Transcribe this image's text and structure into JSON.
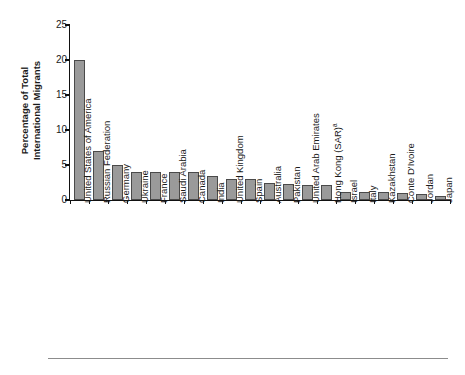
{
  "chart_data": {
    "type": "bar",
    "title": "",
    "xlabel": "",
    "ylabel": "Percentage of Total International Migrants",
    "ylabel_line1": "Percentage of Total",
    "ylabel_line2": "International Migrants",
    "ylim": [
      0,
      25
    ],
    "yticks": [
      0,
      5,
      10,
      15,
      20,
      25
    ],
    "grid": false,
    "legend": false,
    "bar_color": "#9a9a9a",
    "bar_border_color": "#4a4a4a",
    "footnote_marker": "a",
    "categories": [
      "United States of America",
      "Russian Federation",
      "Germany",
      "Ukraine",
      "France",
      "Saudi Arabia",
      "Canada",
      "India",
      "United Kingdom",
      "Spain",
      "Australia",
      "Pakistan",
      "United Arab Emirates",
      "Hong Kong (SAR)",
      "Israel",
      "Italy",
      "Kazakhstan",
      "Conte D'Ivoire",
      "Jordan",
      "Japan"
    ],
    "values": [
      20.0,
      7.0,
      5.0,
      4.0,
      4.0,
      4.0,
      4.0,
      3.5,
      3.0,
      3.0,
      2.5,
      2.3,
      2.2,
      2.1,
      1.2,
      1.2,
      1.1,
      1.0,
      0.8,
      0.6
    ]
  }
}
